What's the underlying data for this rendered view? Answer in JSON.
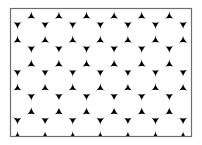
{
  "figure": {
    "frame": {
      "x": 10.5,
      "y": 8.5,
      "width": 181,
      "height": 128,
      "stroke": "#6e6e6e"
    },
    "background_color": "#000000",
    "circle_color": "#ffffff",
    "circle_radius": 14.3,
    "spacing_x": 27.6,
    "spacing_y": 23.9,
    "rows": [
      {
        "y": 8.5,
        "x_start": 17.5
      },
      {
        "y": 32.4,
        "x_start": 3.7
      },
      {
        "y": 56.3,
        "x_start": 17.5
      },
      {
        "y": 80.2,
        "x_start": 3.7
      },
      {
        "y": 104.1,
        "x_start": 17.5
      },
      {
        "y": 128.0,
        "x_start": 3.7
      },
      {
        "y": 151.9,
        "x_start": 17.5
      }
    ]
  }
}
